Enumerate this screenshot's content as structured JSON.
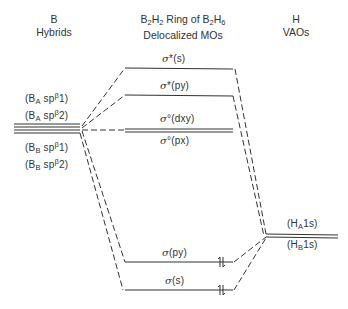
{
  "headers": {
    "left": {
      "line1": "B",
      "line2": "Hybrids"
    },
    "center": {
      "line1_a": "B",
      "line1_a_sub": "2",
      "line1_b": "H",
      "line1_b_sub": "2",
      "line1_c": " Ring of ",
      "line1_d": "B",
      "line1_d_sub": "2",
      "line1_e": "H",
      "line1_e_sub": "6",
      "line2": "Delocalized MOs"
    },
    "right": {
      "line1": "H",
      "line2": "VAOs"
    }
  },
  "b_hybrids": [
    {
      "prefix": "(B",
      "sub": "A",
      "mid": " sp",
      "sup": "β",
      "suffix": "1)"
    },
    {
      "prefix": "(B",
      "sub": "A",
      "mid": " sp",
      "sup": "β",
      "suffix": "2)"
    },
    {
      "prefix": "(B",
      "sub": "B",
      "mid": " sp",
      "sup": "β",
      "suffix": "1)"
    },
    {
      "prefix": "(B",
      "sub": "B",
      "mid": " sp",
      "sup": "β",
      "suffix": "2)"
    }
  ],
  "mos": [
    {
      "sym": "σ",
      "mark": "*",
      "orb": "(s)",
      "y": 68,
      "electrons": 0
    },
    {
      "sym": "σ",
      "mark": "*",
      "orb": "(py)",
      "y": 95,
      "electrons": 0
    },
    {
      "sym": "σ",
      "mark": "°",
      "orb": "(dxy)",
      "y": 129,
      "electrons": 0
    },
    {
      "sym": "σ",
      "mark": "°",
      "orb": "(px)",
      "y": 131,
      "electrons": 0
    },
    {
      "sym": "σ",
      "mark": "",
      "orb": "(py)",
      "y": 262,
      "electrons": 2
    },
    {
      "sym": "σ",
      "mark": "",
      "orb": "(s)",
      "y": 290,
      "electrons": 2
    }
  ],
  "h_vaos": [
    {
      "prefix": "(H",
      "sub": "A",
      "suffix": "1s)"
    },
    {
      "prefix": "(H",
      "sub": "B",
      "suffix": "1s)"
    }
  ],
  "colors": {
    "line": "#333333",
    "text": "#333333",
    "background": "#ffffff"
  }
}
